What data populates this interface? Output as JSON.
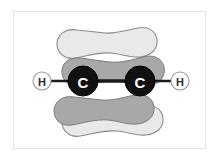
{
  "figure": {
    "molecule_formula": "C2H2",
    "background_color": "#ffffff",
    "frame_color": "#e3e3e3"
  },
  "atoms": [
    {
      "id": "hydrogen-left",
      "element": "H",
      "label": "H",
      "x": 42,
      "y": 81,
      "radius": 9,
      "fill": "#ffffff",
      "stroke": "#9a9a9a",
      "text_color": "#2b2b2b"
    },
    {
      "id": "carbon-left",
      "element": "C",
      "label": "C",
      "x": 83,
      "y": 81,
      "radius": 15,
      "fill": "#111111",
      "stroke": "#000000",
      "text_color": "#ffffff"
    },
    {
      "id": "carbon-right",
      "element": "C",
      "label": "C",
      "x": 140,
      "y": 81,
      "radius": 15,
      "fill": "#111111",
      "stroke": "#000000",
      "text_color": "#ffffff"
    },
    {
      "id": "hydrogen-right",
      "element": "H",
      "label": "H",
      "x": 180,
      "y": 81,
      "radius": 9,
      "fill": "#ffffff",
      "stroke": "#9a9a9a",
      "text_color": "#2b2b2b"
    }
  ],
  "bonds": [
    {
      "id": "bond-h-left-c-left",
      "from": "hydrogen-left",
      "to": "carbon-left",
      "x1": 51,
      "y1": 81,
      "x2": 83,
      "y2": 81,
      "width": 2.4,
      "color": "#1a1a1a"
    },
    {
      "id": "bond-c-c",
      "from": "carbon-left",
      "to": "carbon-right",
      "x1": 83,
      "y1": 81,
      "x2": 140,
      "y2": 81,
      "width": 3.4,
      "color": "#1a1a1a"
    },
    {
      "id": "bond-c-right-h-right",
      "from": "carbon-right",
      "to": "hydrogen-right",
      "x1": 140,
      "y1": 81,
      "x2": 171,
      "y2": 81,
      "width": 2.4,
      "color": "#1a1a1a"
    }
  ],
  "orbital_lobes": [
    {
      "id": "pi-lobe-top-light",
      "description": "upper light-gray pi lobe",
      "fill": "#e9e9e9",
      "stroke": "#8a8a8a",
      "stroke_width": 1.1
    },
    {
      "id": "pi-lobe-bottom-light",
      "description": "lower light-gray pi lobe",
      "fill": "#e9e9e9",
      "stroke": "#8a8a8a",
      "stroke_width": 1.1
    },
    {
      "id": "pi-lobe-middle-medium",
      "description": "middle medium-gray pi lobe behind carbons",
      "fill": "#a8a8a8",
      "stroke": "#7c7c7c",
      "stroke_width": 1.0
    },
    {
      "id": "pi-lobe-bottom-medium",
      "description": "lower medium-gray pi lobe",
      "fill": "#a8a8a8",
      "stroke": "#7c7c7c",
      "stroke_width": 1.0
    }
  ],
  "colors": {
    "light_lobe": "#e9e9e9",
    "medium_lobe": "#a8a8a8",
    "lobe_outline_light": "#8a8a8a",
    "lobe_outline_medium": "#7c7c7c",
    "carbon_fill": "#111111",
    "hydrogen_fill": "#ffffff",
    "bond": "#1a1a1a",
    "frame": "#e3e3e3"
  }
}
